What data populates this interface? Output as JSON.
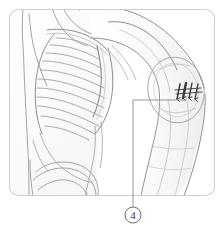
{
  "figure": {
    "type": "anatomical-illustration",
    "background_color": "#ffffff",
    "line_color": "#9a9a9a",
    "dark_line_color": "#555555",
    "frame": {
      "name": "rounded-panel-border",
      "color": "#cfcfcf",
      "x": 9,
      "y": 9,
      "width": 206,
      "height": 187,
      "radius": 9
    },
    "callout": {
      "label": "4",
      "label_style": "circled-number",
      "circle": {
        "cx": 133,
        "cy": 215,
        "r": 8
      },
      "leader": {
        "color": "#8a8a8a",
        "horizontal": {
          "x1": 133,
          "y1": 100,
          "x2": 186,
          "y2": 100
        },
        "vertical": {
          "x1": 133,
          "y1": 100,
          "x2": 133,
          "y2": 207
        }
      },
      "points_to": "injection-needle-marks on deltoid"
    },
    "needle_marks": {
      "name": "injection-arrow-marks",
      "count": 4,
      "color": "#3b3b3b",
      "description": "four short slanted needle strokes with downward arrowheads over the deltoid"
    },
    "anatomy_parts": [
      {
        "name": "neck-and-trapezius",
        "visible": true
      },
      {
        "name": "clavicle",
        "visible": true
      },
      {
        "name": "ribcage",
        "visible": true,
        "rib_count": 10
      },
      {
        "name": "sternum",
        "visible": true
      },
      {
        "name": "scapula-shoulder",
        "visible": true
      },
      {
        "name": "deltoid-muscle",
        "visible": true
      },
      {
        "name": "upper-arm-humerus",
        "visible": true
      },
      {
        "name": "forearm",
        "visible": true
      },
      {
        "name": "abdomen-flank",
        "visible": true
      },
      {
        "name": "pelvis-ilium",
        "visible": true
      }
    ]
  }
}
